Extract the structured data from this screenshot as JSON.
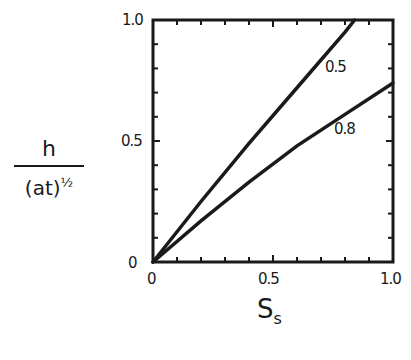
{
  "chart_data": {
    "type": "line",
    "title": "",
    "xlabel": "S_s",
    "ylabel": "h / (at)^1/2",
    "xlim": [
      0,
      1.0
    ],
    "ylim": [
      0,
      1.0
    ],
    "x_ticks": [
      "0",
      "0.5",
      "1.0"
    ],
    "y_ticks": [
      "0",
      "0.5",
      "1.0"
    ],
    "grid": false,
    "legend": "inline curve labels",
    "series": [
      {
        "name": "0.5",
        "x": [
          0,
          0.2,
          0.4,
          0.6,
          0.8,
          0.84
        ],
        "values": [
          0,
          0.25,
          0.49,
          0.72,
          0.95,
          1.0
        ]
      },
      {
        "name": "0.8",
        "x": [
          0,
          0.2,
          0.4,
          0.6,
          0.8,
          1.0
        ],
        "values": [
          0,
          0.17,
          0.33,
          0.48,
          0.61,
          0.74
        ]
      }
    ]
  },
  "labels": {
    "y_num": "h",
    "y_den": "(at)",
    "y_exp": "½",
    "x_main": "S",
    "x_sub": "s",
    "tick_y_0": "0",
    "tick_y_05": "0.5",
    "tick_y_10": "1.0",
    "tick_x_0": "0",
    "tick_x_05": "0.5",
    "tick_x_10": "1.0",
    "curve_05": "0.5",
    "curve_08": "0.8"
  }
}
